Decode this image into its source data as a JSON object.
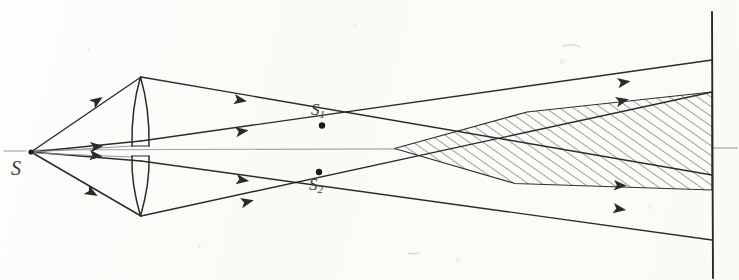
{
  "figure": {
    "kind": "hand-drawn optical ray diagram",
    "medium": "pencil sketch on aged paper",
    "background_color": "#fdfdfb",
    "ink_color": "#2e2e2e",
    "axis_color": "#8d8d8d",
    "width": 739,
    "height": 280
  },
  "labels": {
    "source": "S",
    "image1_main": "S",
    "image1_sub": "1",
    "image2_main": "S",
    "image2_sub": "2"
  },
  "elements": {
    "source_point": {
      "name": "S",
      "x": 31,
      "y": 152
    },
    "image_point_1": {
      "name": "S1",
      "x": 322,
      "y": 125
    },
    "image_point_2": {
      "name": "S2",
      "x": 319,
      "y": 172
    },
    "lens": {
      "name": "biconvex-split-lens",
      "center_x": 141,
      "top_apex_y": 77,
      "bottom_apex_y": 216,
      "half_width": 10,
      "split_gap_y": [
        145,
        155
      ]
    },
    "screen": {
      "name": "observation-screen",
      "x": 712,
      "y_top": 12,
      "y_bottom": 278
    },
    "optical_axis": {
      "y": 149,
      "x_start": 4,
      "x_end": 739
    },
    "overlap_region": {
      "name": "interference-overlap",
      "hatched": true,
      "hatch_angle_deg": 55,
      "apex": {
        "x": 394,
        "y": 148
      },
      "screen_top_y": 92,
      "screen_bottom_y": 190,
      "upper_kink": {
        "x": 527,
        "y": 112
      },
      "lower_kink": {
        "x": 515,
        "y": 183
      }
    }
  },
  "rays": [
    {
      "name": "incident-upper",
      "from": [
        31,
        152
      ],
      "to": [
        141,
        77
      ],
      "arrow_at": [
        98,
        108
      ]
    },
    {
      "name": "incident-lower",
      "from": [
        31,
        152
      ],
      "to": [
        141,
        216
      ],
      "arrow_at": [
        98,
        193
      ]
    },
    {
      "name": "incident-axial-upper",
      "from": [
        31,
        152
      ],
      "to": [
        141,
        142
      ],
      "arrow_at": [
        100,
        148
      ]
    },
    {
      "name": "incident-axial-lower",
      "from": [
        31,
        152
      ],
      "to": [
        141,
        160
      ],
      "arrow_at": [
        100,
        156
      ]
    },
    {
      "name": "refracted-upper-outer",
      "from": [
        141,
        77
      ],
      "to": [
        712,
        175
      ],
      "arrow_at": [
        245,
        100
      ]
    },
    {
      "name": "refracted-upper-inner",
      "from": [
        141,
        142
      ],
      "to": [
        712,
        92
      ],
      "arrow_at": [
        245,
        132
      ]
    },
    {
      "name": "refracted-lower-inner",
      "from": [
        141,
        160
      ],
      "to": [
        712,
        190
      ],
      "arrow_at": [
        245,
        168
      ]
    },
    {
      "name": "refracted-lower-outer",
      "from": [
        141,
        216
      ],
      "to": [
        712,
        228
      ],
      "arrow_at": [
        248,
        203
      ]
    },
    {
      "name": "upper-beam-edge-right",
      "from": [
        322,
        125
      ],
      "to": [
        712,
        60
      ],
      "arrow_at": [
        625,
        83
      ]
    },
    {
      "name": "lower-beam-edge-right",
      "from": [
        319,
        172
      ],
      "to": [
        712,
        240
      ],
      "arrow_at": [
        622,
        208
      ]
    }
  ],
  "arrowheads": {
    "count": 10,
    "style": "solid filled triangle"
  }
}
